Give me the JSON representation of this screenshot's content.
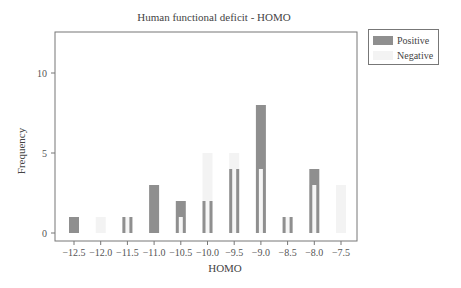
{
  "chart_data": {
    "type": "bar",
    "title": "Human functional deficit - HOMO",
    "xlabel": "HOMO",
    "ylabel": "Frequency",
    "ylim": [
      -0.5,
      12.5
    ],
    "xlim": [
      -12.85,
      -7.1
    ],
    "yticks": [
      0,
      5,
      10
    ],
    "xticks": [
      "-12.5",
      "-12.0",
      "-11.5",
      "-11.0",
      "-10.5",
      "-10.0",
      "-9.5",
      "-9.0",
      "-8.5",
      "-8.0",
      "-7.5"
    ],
    "categories": [
      -12.5,
      -12.0,
      -11.5,
      -11.0,
      -10.5,
      -10.0,
      -9.5,
      -9.0,
      -8.5,
      -8.0,
      -7.5
    ],
    "series": [
      {
        "name": "Positive",
        "color": "#8f8f8f",
        "values": [
          1,
          0,
          1,
          3,
          2,
          2,
          4,
          8,
          1,
          4,
          0
        ]
      },
      {
        "name": "Negative",
        "color": "#f3f3f3",
        "values": [
          0,
          1,
          1,
          0,
          1,
          5,
          5,
          4,
          1,
          3,
          3
        ]
      }
    ],
    "legend_position": "upper right, outside plot",
    "grid": false
  },
  "legend": {
    "positive": "Positive",
    "negative": "Negative"
  }
}
